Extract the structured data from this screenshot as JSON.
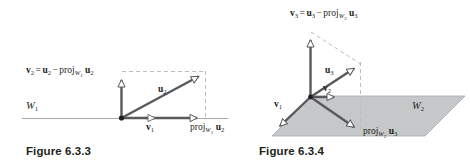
{
  "page": {
    "background_color": "#ffffff",
    "width": 470,
    "height": 163
  },
  "figures": [
    {
      "id": "figure-6-3-3",
      "caption": "Figure 6.3.3",
      "subspace_label_text": "W1",
      "description": "Two-dimensional projection diagram: vector u2 decomposed into proj onto W1 and orthogonal component v2",
      "colors": {
        "solid_vector": "#58595b",
        "dashed_guide": "#bcbec0",
        "axis_line": "#a7a9ac",
        "text": "#231f20"
      },
      "labels": {
        "v2_decomposition": {
          "v": "v",
          "v_sub": "2",
          "equals": "=",
          "u": "u",
          "u_sub": "2",
          "minus": "−",
          "proj": "proj",
          "proj_sub_W": "W",
          "proj_sub_W_sub": "1",
          "u2": "u",
          "u2_sub": "2"
        },
        "u2": {
          "base": "u",
          "sub": "2"
        },
        "v1": {
          "base": "v",
          "sub": "1"
        },
        "proj_w1_u2": {
          "proj": "proj",
          "sub_W": "W",
          "sub_W_sub": "1",
          "u": "u",
          "u_sub": "2"
        },
        "W1": {
          "base": "W",
          "sub": "1"
        }
      }
    },
    {
      "id": "figure-6-3-4",
      "caption": "Figure 6.3.4",
      "subspace_label_text": "W2",
      "description": "Three-dimensional projection diagram: vector u3 decomposed into proj onto plane W2 and orthogonal component v3",
      "colors": {
        "solid_vector": "#58595b",
        "dashed_guide": "#bcbec0",
        "plane_fill": "#c6c7c9",
        "plane_edge": "#a7a9ac",
        "text": "#231f20"
      },
      "labels": {
        "v3_decomposition": {
          "v": "v",
          "v_sub": "3",
          "equals": "=",
          "u": "u",
          "u_sub": "3",
          "minus": "−",
          "proj": "proj",
          "proj_sub_W": "W",
          "proj_sub_W_sub": "2",
          "u2": "u",
          "u2_sub": "3"
        },
        "u3": {
          "base": "u",
          "sub": "3"
        },
        "v2": {
          "base": "v",
          "sub": "2"
        },
        "v1": {
          "base": "v",
          "sub": "1"
        },
        "proj_w2_u3": {
          "proj": "proj",
          "sub_W": "W",
          "sub_W_sub": "2",
          "u": "u",
          "u_sub": "3"
        },
        "W2": {
          "base": "W",
          "sub": "2"
        }
      }
    }
  ]
}
